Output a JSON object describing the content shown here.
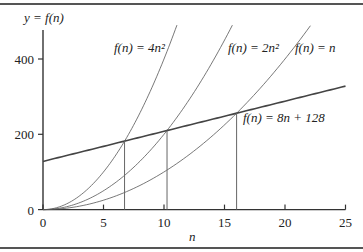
{
  "chart_data": {
    "type": "line",
    "title": "",
    "xlabel": "n",
    "ylabel": "y = f(n)",
    "xlim": [
      0,
      25
    ],
    "ylim": [
      0,
      490
    ],
    "x_ticks": [
      0,
      5,
      10,
      15,
      20,
      25
    ],
    "y_ticks": [
      0,
      200,
      400
    ],
    "grid": false,
    "legend": "inline labels",
    "series": [
      {
        "name": "f(n) = 4n²",
        "label": "f(n) = 4n²",
        "formula": "4*n^2",
        "x": [
          0,
          2,
          4,
          6,
          8,
          10,
          11.07
        ],
        "values": [
          0,
          16,
          64,
          144,
          256,
          400,
          490
        ]
      },
      {
        "name": "f(n) = 2n²",
        "label": "f(n) = 2n²",
        "formula": "2*n^2",
        "x": [
          0,
          2,
          4,
          6,
          8,
          10,
          12,
          14,
          15.65
        ],
        "values": [
          0,
          8,
          32,
          72,
          128,
          200,
          288,
          392,
          490
        ]
      },
      {
        "name": "f(n) = n",
        "label": "f(n) = n",
        "formula": "n^2",
        "x": [
          0,
          4,
          8,
          12,
          16,
          20,
          22.1
        ],
        "values": [
          0,
          16,
          64,
          144,
          256,
          400,
          490
        ]
      },
      {
        "name": "f(n) = 8n + 128",
        "label": "f(n) = 8n + 128",
        "formula": "8*n+128",
        "x": [
          0,
          25
        ],
        "values": [
          128,
          328
        ]
      }
    ],
    "annotations": [
      {
        "type": "vertical-line",
        "x": 6.74,
        "y": 181.9,
        "note": "4n² = 8n + 128"
      },
      {
        "type": "vertical-line",
        "x": 10.25,
        "y": 210.0,
        "note": "2n² = 8n + 128"
      },
      {
        "type": "vertical-line",
        "x": 16,
        "y": 256,
        "note": "n² = 8n + 128"
      }
    ]
  },
  "labels": {
    "ylabel": "y = f(n)",
    "xlabel": "n",
    "curve_4n2": "f(n) = 4n²",
    "curve_2n2": "f(n) = 2n²",
    "curve_n": "f(n) = n",
    "line": "f(n) = 8n + 128"
  }
}
